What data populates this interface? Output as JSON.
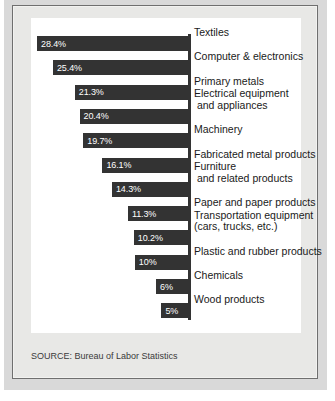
{
  "figure": {
    "source_note": "SOURCE: Bureau of Labor Statistics",
    "colors": {
      "bar": "#333333",
      "panel": "#ffffff",
      "frame": "#e8e8e6",
      "paper": "#d9d9d9",
      "value_text": "#ffffff",
      "label_text": "#1a1a1a"
    }
  },
  "chart_data": {
    "type": "bar",
    "orientation": "horizontal",
    "title": "",
    "subtitle": "",
    "xlabel": "",
    "ylabel": "",
    "grid": false,
    "legend": false,
    "value_suffix": "%",
    "xlim": [
      0,
      28.4
    ],
    "note": "Bars are right-anchored to a common vertical axis and extend leftward; length is proportional to the percentage.",
    "categories": [
      "Textiles",
      "Computer & electronics",
      "Primary metals",
      "Electrical equipment\n and appliances",
      "Machinery",
      "Fabricated metal products",
      "Furniture\n and related products",
      "Paper and paper products",
      "Transportation equipment\n(cars, trucks, etc.)",
      "Plastic and rubber products",
      "Chemicals",
      "Wood products"
    ],
    "values": [
      28.4,
      25.4,
      21.3,
      20.4,
      19.7,
      16.1,
      14.3,
      11.3,
      10.2,
      10,
      6,
      5
    ],
    "value_labels": [
      "28.4%",
      "25.4%",
      "21.3%",
      "20.4%",
      "19.7%",
      "16.1%",
      "14.3%",
      "11.3%",
      "10.2%",
      "10%",
      "6%",
      "5%"
    ],
    "source": "Bureau of Labor Statistics"
  }
}
